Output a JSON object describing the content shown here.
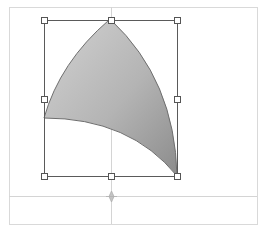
{
  "editor": {
    "description": "Vector shape editing canvas with selected curved triangular shape and transform handles",
    "colors": {
      "canvas_border": "#d9d9d9",
      "guide_line": "#d4d4d4",
      "bbox_line": "#5a5a5a",
      "handle_fill": "#ffffff",
      "handle_stroke": "#555555",
      "shape_fill_light": "#cfcfcf",
      "shape_fill_dark": "#8e8e8e",
      "shape_outline": "#6e6e6e",
      "crosshair": "#b0b0b0"
    },
    "canvas_border": {
      "x": 9,
      "y": 7,
      "width": 248,
      "height": 217
    },
    "guides": {
      "vertical_x": 111,
      "horizontal_y": 196
    },
    "selection": {
      "x": 44,
      "y": 20,
      "width": 133,
      "height": 156,
      "handles": [
        {
          "name": "top-left",
          "x": 44,
          "y": 20
        },
        {
          "name": "top-center",
          "x": 111,
          "y": 20
        },
        {
          "name": "top-right",
          "x": 177,
          "y": 20
        },
        {
          "name": "middle-left",
          "x": 44,
          "y": 99
        },
        {
          "name": "middle-right",
          "x": 177,
          "y": 99
        },
        {
          "name": "bottom-left",
          "x": 44,
          "y": 176
        },
        {
          "name": "bottom-center",
          "x": 111,
          "y": 176
        },
        {
          "name": "bottom-right",
          "x": 177,
          "y": 176
        }
      ]
    },
    "shape": {
      "type": "curved-triangle",
      "path": "M109,20 Q60,62 44,118 Q130,118 177,176 Q175,80 111,20 Z"
    },
    "pivot": {
      "x": 111,
      "y": 196
    }
  }
}
